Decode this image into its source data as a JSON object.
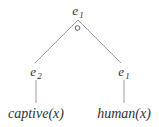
{
  "diagram": {
    "type": "tree",
    "edge_color": "#9a9a9a",
    "text_color": "#333333",
    "root": {
      "label": "e",
      "subscript": "1",
      "marker": "circle"
    },
    "children": [
      {
        "label": "e",
        "subscript": "2",
        "leaf": "captive(x)"
      },
      {
        "label": "e",
        "subscript": "1",
        "leaf": "human(x)"
      }
    ]
  }
}
